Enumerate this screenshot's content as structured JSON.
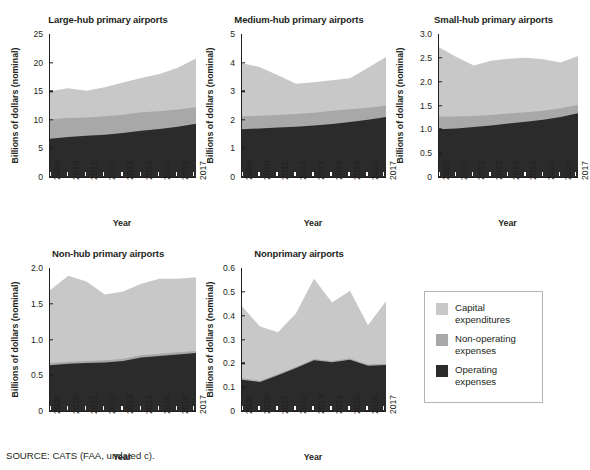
{
  "figure": {
    "source_note": "SOURCE: CATS (FAA, undated c)."
  },
  "legend": {
    "items": [
      {
        "label": "Capital\nexpenditures",
        "color": "#c8c8c8",
        "key": "capital"
      },
      {
        "label": "Non-operating\nexpenses",
        "color": "#a8a8a8",
        "key": "nonoperating"
      },
      {
        "label": "Operating\nexpenses",
        "color": "#2b2b2b",
        "key": "operating"
      }
    ]
  },
  "axis_titles": {
    "x": "Year",
    "y": "Billions of dollars (nominal)"
  },
  "chart_data": [
    {
      "type": "area",
      "id": "large-hub",
      "title": "Large-hub primary airports",
      "xlabel": "Year",
      "ylabel": "Billions of dollars (nominal)",
      "x": [
        "2009",
        "2010",
        "2011",
        "2012",
        "2013",
        "2014",
        "2015",
        "2016",
        "2017"
      ],
      "ylim": [
        0,
        25
      ],
      "yticks": [
        0,
        5,
        10,
        15,
        20,
        25
      ],
      "ytick_labels": [
        "0",
        "5",
        "10",
        "15",
        "20",
        "25"
      ],
      "grid": false,
      "stacked": true,
      "series": [
        {
          "name": "Operating expenses",
          "color": "#2b2b2b",
          "values": [
            6.7,
            7.0,
            7.2,
            7.4,
            7.7,
            8.1,
            8.4,
            8.8,
            9.3
          ]
        },
        {
          "name": "Non-operating expenses",
          "color": "#a8a8a8",
          "values": [
            3.4,
            3.3,
            3.2,
            3.2,
            3.2,
            3.2,
            3.1,
            3.0,
            2.9
          ]
        },
        {
          "name": "Capital expenditures",
          "color": "#c8c8c8",
          "values": [
            4.9,
            5.2,
            4.7,
            5.1,
            5.6,
            6.0,
            6.5,
            7.3,
            8.5
          ]
        }
      ],
      "totals": [
        15.0,
        15.5,
        15.1,
        15.7,
        16.5,
        17.3,
        18.0,
        19.1,
        20.7
      ]
    },
    {
      "type": "area",
      "id": "medium-hub",
      "title": "Medium-hub primary airports",
      "xlabel": "Year",
      "ylabel": "Billions of dollars (nominal)",
      "x": [
        "2009",
        "2010",
        "2011",
        "2012",
        "2013",
        "2014",
        "2015",
        "2016",
        "2017"
      ],
      "ylim": [
        0,
        5
      ],
      "yticks": [
        0,
        1,
        2,
        3,
        4,
        5
      ],
      "ytick_labels": [
        "0",
        "1",
        "2",
        "3",
        "4",
        "5"
      ],
      "grid": false,
      "stacked": true,
      "series": [
        {
          "name": "Operating expenses",
          "color": "#2b2b2b",
          "values": [
            1.67,
            1.7,
            1.73,
            1.76,
            1.8,
            1.85,
            1.92,
            2.0,
            2.1
          ]
        },
        {
          "name": "Non-operating expenses",
          "color": "#a8a8a8",
          "values": [
            0.45,
            0.44,
            0.44,
            0.44,
            0.45,
            0.47,
            0.45,
            0.42,
            0.4
          ]
        },
        {
          "name": "Capital expenditures",
          "color": "#c8c8c8",
          "values": [
            1.86,
            1.7,
            1.39,
            1.06,
            1.06,
            1.06,
            1.08,
            1.4,
            1.7
          ]
        }
      ],
      "totals": [
        3.98,
        3.84,
        3.56,
        3.26,
        3.31,
        3.38,
        3.45,
        3.82,
        4.2
      ]
    },
    {
      "type": "area",
      "id": "small-hub",
      "title": "Small-hub primary airports",
      "xlabel": "Year",
      "ylabel": "Billions of dollars (nominal)",
      "x": [
        "2009",
        "2010",
        "2011",
        "2012",
        "2013",
        "2014",
        "2015",
        "2016",
        "2017"
      ],
      "ylim": [
        0,
        3.0
      ],
      "yticks": [
        0,
        0.5,
        1.0,
        1.5,
        2.0,
        2.5,
        3.0
      ],
      "ytick_labels": [
        "0",
        "0.5",
        "1.0",
        "1.5",
        "2.0",
        "2.5",
        "3.0"
      ],
      "grid": false,
      "stacked": true,
      "series": [
        {
          "name": "Operating expenses",
          "color": "#2b2b2b",
          "values": [
            1.0,
            1.02,
            1.05,
            1.08,
            1.12,
            1.16,
            1.2,
            1.26,
            1.34
          ]
        },
        {
          "name": "Non-operating expenses",
          "color": "#a8a8a8",
          "values": [
            0.27,
            0.25,
            0.23,
            0.22,
            0.21,
            0.2,
            0.19,
            0.18,
            0.17
          ]
        },
        {
          "name": "Capital expenditures",
          "color": "#c8c8c8",
          "values": [
            1.45,
            1.25,
            1.06,
            1.14,
            1.15,
            1.14,
            1.08,
            0.96,
            1.03
          ]
        }
      ],
      "totals": [
        2.72,
        2.52,
        2.34,
        2.44,
        2.48,
        2.5,
        2.47,
        2.4,
        2.54
      ]
    },
    {
      "type": "area",
      "id": "non-hub",
      "title": "Non-hub primary airports",
      "xlabel": "Year",
      "ylabel": "Billions of dollars (nominal)",
      "x": [
        "2009",
        "2010",
        "2011",
        "2012",
        "2013",
        "2014",
        "2015",
        "2016",
        "2017"
      ],
      "ylim": [
        0,
        2.0
      ],
      "yticks": [
        0,
        0.5,
        1.0,
        1.5,
        2.0
      ],
      "ytick_labels": [
        "0",
        "0.5",
        "1.0",
        "1.5",
        "2.0"
      ],
      "grid": false,
      "stacked": true,
      "series": [
        {
          "name": "Operating expenses",
          "color": "#2b2b2b",
          "values": [
            0.64,
            0.66,
            0.67,
            0.68,
            0.7,
            0.75,
            0.77,
            0.79,
            0.81
          ]
        },
        {
          "name": "Non-operating expenses",
          "color": "#a8a8a8",
          "values": [
            0.03,
            0.03,
            0.03,
            0.03,
            0.03,
            0.03,
            0.03,
            0.03,
            0.03
          ]
        },
        {
          "name": "Capital expenditures",
          "color": "#c8c8c8",
          "values": [
            1.02,
            1.2,
            1.11,
            0.92,
            0.94,
            1.0,
            1.05,
            1.03,
            1.03
          ]
        }
      ],
      "totals": [
        1.69,
        1.89,
        1.81,
        1.63,
        1.67,
        1.78,
        1.85,
        1.85,
        1.87
      ]
    },
    {
      "type": "area",
      "id": "nonprimary",
      "title": "Nonprimary airports",
      "xlabel": "Year",
      "ylabel": "Billions of dollars (nominal)",
      "x": [
        "2009",
        "2010",
        "2011",
        "2012",
        "2013",
        "2014",
        "2015",
        "2016",
        "2017"
      ],
      "ylim": [
        0,
        0.6
      ],
      "yticks": [
        0,
        0.1,
        0.2,
        0.3,
        0.4,
        0.5,
        0.6
      ],
      "ytick_labels": [
        "0",
        "0.1",
        "0.2",
        "0.3",
        "0.4",
        "0.5",
        "0.6"
      ],
      "grid": false,
      "stacked": true,
      "series": [
        {
          "name": "Operating expenses",
          "color": "#2b2b2b",
          "values": [
            0.131,
            0.122,
            0.15,
            0.18,
            0.213,
            0.205,
            0.215,
            0.19,
            0.193
          ]
        },
        {
          "name": "Non-operating expenses",
          "color": "#a8a8a8",
          "values": [
            0.006,
            0.005,
            0.005,
            0.005,
            0.005,
            0.005,
            0.005,
            0.005,
            0.005
          ]
        },
        {
          "name": "Capital expenditures",
          "color": "#c8c8c8",
          "values": [
            0.303,
            0.228,
            0.175,
            0.225,
            0.337,
            0.245,
            0.285,
            0.165,
            0.262
          ]
        }
      ],
      "totals": [
        0.44,
        0.355,
        0.33,
        0.41,
        0.555,
        0.455,
        0.505,
        0.36,
        0.46
      ]
    }
  ]
}
